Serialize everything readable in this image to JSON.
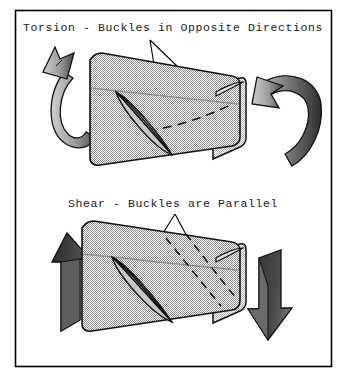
{
  "figure": {
    "title_torsion": "Torsion - Buckles in Opposite Directions",
    "title_shear": "Shear - Buckles are Parallel",
    "frame": {
      "border_color": "#000000",
      "background_color": "#ffffff"
    },
    "colors": {
      "body_fill": "#a9a9a9",
      "body_fill_light": "#c2c2c2",
      "body_fill_dark": "#949494",
      "outline": "#111111",
      "arrow_dark": "#3b3b3b",
      "arrow_mid": "#8f8f8f",
      "arrow_light": "#b8b8b8",
      "buckle_fill": "#bdbdbd",
      "leader_line": "#000000"
    },
    "panels": [
      {
        "id": "torsion",
        "label": "Torsion - Buckles in Opposite Directions",
        "load_type": "torsion",
        "arrow_style": "curved-ribbon-moment",
        "arrow_count": 2,
        "arrow_left_direction": "up",
        "arrow_right_direction": "down",
        "buckle_solid": "diagonal down-right",
        "buckle_dashed": "opposite diagonal",
        "buckle_relation": "opposite"
      },
      {
        "id": "shear",
        "label": "Shear - Buckles are Parallel",
        "load_type": "shear",
        "arrow_style": "straight-block",
        "arrow_count": 2,
        "arrow_left_direction": "up",
        "arrow_right_direction": "down",
        "buckle_solid": "diagonal down-right",
        "buckle_dashed": "diagonal down-right",
        "buckle_relation": "parallel"
      }
    ]
  }
}
